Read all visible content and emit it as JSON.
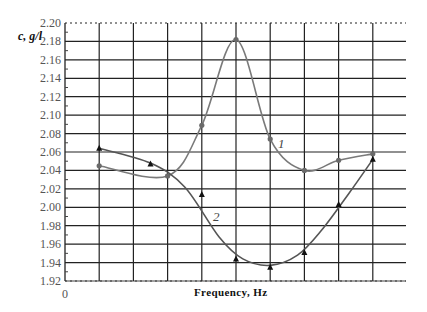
{
  "chart_data": {
    "type": "line",
    "title": "",
    "xlabel": "Frequency, Hz",
    "ylabel": "c, g/l",
    "x_origin_label": "0",
    "ylim": [
      1.92,
      2.2
    ],
    "yticks": [
      "2.20",
      "2.18",
      "2.16",
      "2.14",
      "2.12",
      "2.10",
      "2.08",
      "2.06",
      "2.04",
      "2.02",
      "2.00",
      "1.98",
      "1.96",
      "1.94",
      "1.92"
    ],
    "x_grid_count": 10,
    "grid": true,
    "legend": "inline curve labels",
    "series": [
      {
        "name": "1",
        "marker": "circle",
        "color": "#7a7a7a",
        "x": [
          1,
          3,
          4,
          5,
          6,
          7,
          8,
          9
        ],
        "values": [
          2.045,
          2.034,
          2.089,
          2.182,
          2.074,
          2.04,
          2.051,
          2.058
        ]
      },
      {
        "name": "2",
        "marker": "triangle",
        "color": "#555555",
        "x": [
          1,
          2.5,
          4,
          5,
          6,
          7,
          8,
          9
        ],
        "values": [
          2.064,
          2.047,
          2.014,
          1.944,
          1.935,
          1.951,
          2.003,
          2.052
        ]
      }
    ]
  }
}
